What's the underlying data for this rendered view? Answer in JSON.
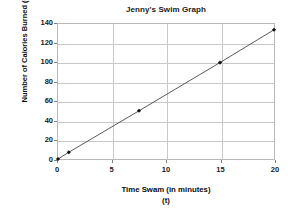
{
  "chart_data": {
    "type": "line",
    "title": "Jenny's Swim Graph",
    "xlabel": "Time Swam (in minutes)",
    "xlabel_variable": "(t)",
    "ylabel": "Number of Calories Burned (C)",
    "xlim": [
      0,
      20
    ],
    "ylim": [
      0,
      140
    ],
    "xticks": [
      0,
      5,
      10,
      15,
      20
    ],
    "yticks": [
      0,
      20,
      40,
      60,
      80,
      100,
      120,
      140
    ],
    "xtick_labels": [
      "0",
      "5",
      "10",
      "15",
      "20"
    ],
    "ytick_labels": [
      "0",
      "20",
      "40",
      "60",
      "80",
      "100",
      "120",
      "140"
    ],
    "grid": true,
    "legend": false,
    "marker": "diamond",
    "line_color": "#444444",
    "marker_color": "#111111",
    "grid_color": "#c8c8c8",
    "series": [
      {
        "name": "Calories burned",
        "x": [
          0,
          1,
          7.5,
          15,
          20
        ],
        "values": [
          0,
          7,
          50,
          100,
          134
        ],
        "points": [
          {
            "x": 0,
            "y": 0
          },
          {
            "x": 1,
            "y": 7
          },
          {
            "x": 7.5,
            "y": 50
          },
          {
            "x": 15,
            "y": 100
          },
          {
            "x": 20,
            "y": 134
          }
        ]
      }
    ]
  }
}
